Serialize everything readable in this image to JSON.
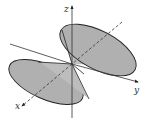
{
  "figure": {
    "axes": {
      "x_label": "x",
      "y_label": "y",
      "z_label": "z"
    },
    "colors": {
      "fill": "#b3b3b3",
      "stroke": "#222222",
      "background": "#ffffff"
    }
  }
}
